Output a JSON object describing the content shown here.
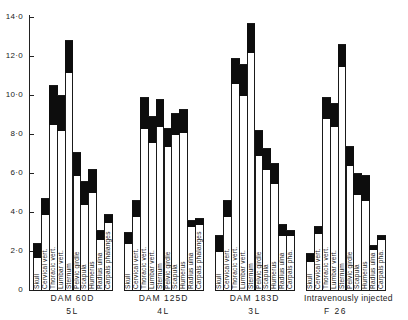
{
  "chart_data": {
    "type": "bar",
    "subtype": "stacked-range (white lower portion, black upper portion)",
    "title": "",
    "xlabel": "",
    "ylabel": "",
    "ylim": [
      0,
      14
    ],
    "yticks": [
      0,
      2,
      4,
      6,
      8,
      10,
      12,
      14
    ],
    "ytick_labels": [
      "0",
      "2·0",
      "4·0",
      "6·0",
      "8·0",
      "10·0",
      "12·0",
      "14·0"
    ],
    "grid": false,
    "legend": null,
    "categories": [
      "Skull",
      "Cervical vert.",
      "Thoracic vert.",
      "Lumbar vert.",
      "Sternum",
      "Pelvic girdle",
      "Scapula",
      "Humerus",
      "Radius ulna",
      "Carpals phalanges"
    ],
    "groups": [
      {
        "name": "DAM 60D",
        "sub": "5L",
        "labels": [
          "Skull",
          "Cervical vert.",
          "Thoracic vert.",
          "Lumbar vert.",
          "Sternum",
          "Pelvic girdle",
          "Scapula",
          "Humerus",
          "Radius ulna",
          "Carpals phalanges"
        ],
        "low": [
          1.7,
          3.9,
          8.5,
          8.2,
          11.2,
          5.9,
          4.4,
          5.0,
          2.6,
          3.5
        ],
        "high": [
          2.4,
          4.7,
          10.5,
          10.0,
          12.8,
          7.1,
          5.6,
          6.2,
          3.1,
          3.9
        ]
      },
      {
        "name": "DAM 125D",
        "sub": "4L",
        "labels": [
          "Skull",
          "Cervical vert.",
          "Thoracic vert.",
          "Lumbar vert.",
          "Sternum",
          "Pelvic girdle",
          "Scapula",
          "Humerus",
          "Radius ulna",
          "Carpals phalanges"
        ],
        "low": [
          2.4,
          3.8,
          8.3,
          7.6,
          8.4,
          7.4,
          8.0,
          8.1,
          3.3,
          3.4
        ],
        "high": [
          3.0,
          4.6,
          9.9,
          8.9,
          9.8,
          8.3,
          9.1,
          9.3,
          3.6,
          3.7
        ]
      },
      {
        "name": "DAM 183D",
        "sub": "3L",
        "labels": [
          "Skull",
          "Cervical vert.",
          "Thoracic vert.",
          "Lumbar vert.",
          "Sternum",
          "Pelvic girdle",
          "Scapula",
          "Humerus",
          "Radius ulna",
          "Carpals pha."
        ],
        "low": [
          2.0,
          3.8,
          10.6,
          10.0,
          12.2,
          6.9,
          6.2,
          5.5,
          2.8,
          2.8
        ],
        "high": [
          2.8,
          4.6,
          11.9,
          11.6,
          13.7,
          8.2,
          7.3,
          6.5,
          3.4,
          3.1
        ]
      },
      {
        "name": "Intravenously injected",
        "sub": "F 26",
        "labels": [
          "Skull",
          "Cervical vert.",
          "Thoracic vert.",
          "Lumbar vert.",
          "Sternum",
          "Pelvic girdle",
          "Scapula",
          "Humerus",
          "Radius ulna",
          "Carpals pha."
        ],
        "low": [
          1.5,
          2.9,
          8.8,
          8.4,
          11.5,
          6.4,
          4.9,
          4.6,
          2.1,
          2.6
        ],
        "high": [
          1.9,
          3.3,
          9.9,
          9.6,
          12.6,
          7.4,
          6.0,
          5.9,
          2.3,
          2.8
        ]
      }
    ]
  },
  "layout": {
    "zero_y": 290,
    "px_per_unit": 19.5,
    "axis_x": 29,
    "group_x": [
      33,
      124,
      215,
      306
    ],
    "bar_width": 7.9,
    "label_box_height": 30
  }
}
